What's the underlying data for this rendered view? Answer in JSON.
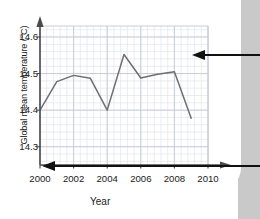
{
  "chart_data": {
    "type": "line",
    "title": "",
    "xlabel": "Year",
    "ylabel": "Global mean temperature (°C)",
    "x": [
      2000,
      2001,
      2002,
      2003,
      2004,
      2005,
      2006,
      2007,
      2008,
      2009
    ],
    "values": [
      14.4,
      14.478,
      14.495,
      14.487,
      14.4,
      14.552,
      14.488,
      14.498,
      14.505,
      14.378
    ],
    "series": [
      {
        "name": "Global mean temperature",
        "values": [
          14.4,
          14.478,
          14.495,
          14.487,
          14.4,
          14.552,
          14.488,
          14.498,
          14.505,
          14.378
        ]
      }
    ],
    "xlim": [
      2000,
      2010
    ],
    "ylim": [
      14.25,
      14.63
    ],
    "xticks": [
      2000,
      2002,
      2004,
      2006,
      2008,
      2010
    ],
    "xtick_labels": [
      "2000",
      "2002",
      "2004",
      "2006",
      "2008",
      "2010"
    ],
    "yticks": [
      14.3,
      14.4,
      14.5,
      14.6
    ],
    "ytick_labels": [
      "14.3",
      "14.4",
      "14.5",
      "14.6"
    ],
    "grid": true,
    "grid_minor": true,
    "legend": "none",
    "line_color": "#6e6e6e",
    "grid_color": "#c3c8d8",
    "grid_minor_color": "#dde0ea",
    "axis_color": "#4a4a4a"
  },
  "axes": {
    "y_title": "Global mean temperature (°C)",
    "x_title": "Year",
    "y_labels": [
      "14.6",
      "14.5",
      "14.4",
      "14.3"
    ],
    "x_labels": [
      "2000",
      "2002",
      "2004",
      "2006",
      "2008",
      "2010"
    ]
  },
  "annotations": {
    "arrow_right_label": "",
    "arrow_bottom_label": ""
  },
  "colors": {
    "page_edge": "#c9c9c9",
    "line": "#6e6e6e",
    "grid_major": "#c3c8d8",
    "grid_minor": "#dde0ea",
    "text": "#1a1a1a",
    "annotation": "#111111"
  }
}
